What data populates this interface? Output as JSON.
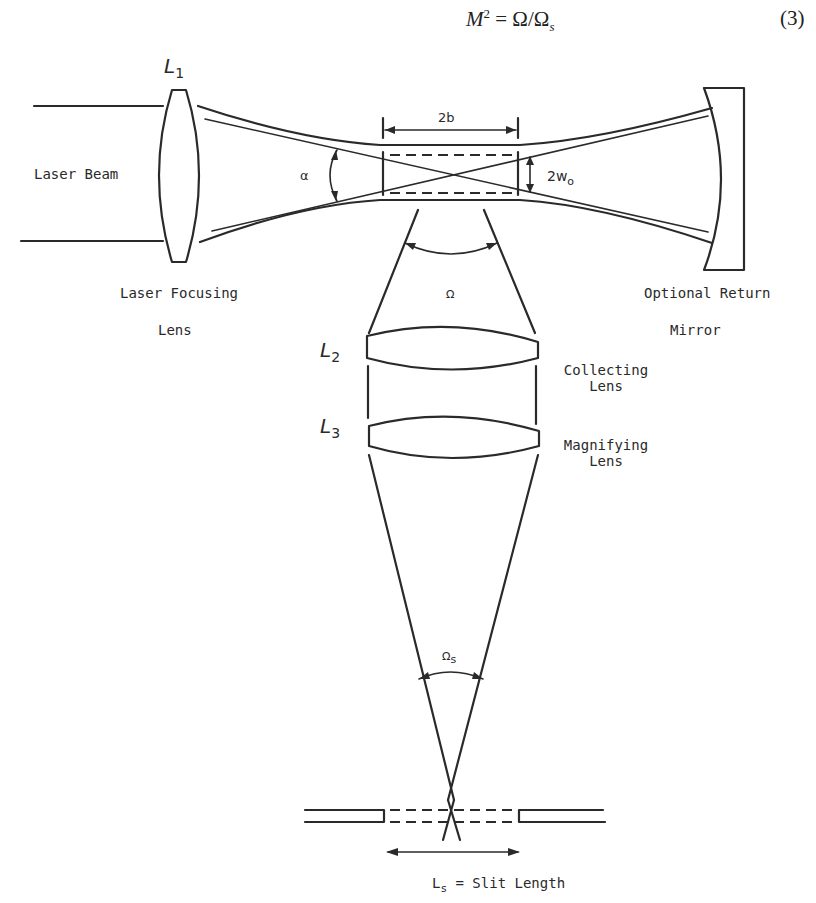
{
  "equation": {
    "lhs_var": "M",
    "lhs_exp": "2",
    "rhs": "= Ω/Ω",
    "rhs_sub": "s",
    "number": "(3)"
  },
  "lenses": {
    "l1": {
      "symbol": "L",
      "index": "1"
    },
    "l2": {
      "symbol": "L",
      "index": "2"
    },
    "l3": {
      "symbol": "L",
      "index": "3"
    }
  },
  "labels": {
    "laser_beam": "Laser Beam",
    "laser_focusing_line1": "Laser Focusing",
    "laser_focusing_line2": "Lens",
    "optional_return_line1": "Optional Return",
    "optional_return_line2": "Mirror",
    "collecting_line1": "Collecting",
    "collecting_line2": "Lens",
    "magnifying_line1": "Magnifying",
    "magnifying_line2": "Lens",
    "slit_symbol": "L",
    "slit_sub": "s",
    "slit_text": "= Slit Length"
  },
  "symbols": {
    "alpha": "α",
    "two_b": "2b",
    "two_w": "2w",
    "two_w_sub": "o",
    "omega": "Ω",
    "omega_s": "Ω",
    "omega_s_sub": "s"
  }
}
